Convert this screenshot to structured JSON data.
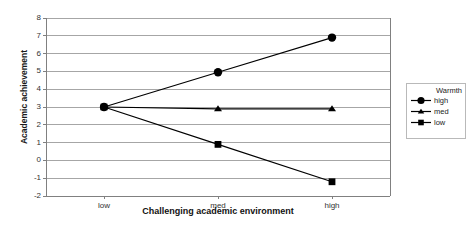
{
  "chart_data": {
    "type": "line",
    "title": "",
    "xlabel": "Challenging academic environment",
    "ylabel": "Academic achievement",
    "categories": [
      "low",
      "med",
      "high"
    ],
    "ylim": [
      -2,
      8
    ],
    "ytick_step": 1,
    "yticks": [
      "8",
      "7",
      "6",
      "5",
      "4",
      "3",
      "2",
      "1",
      "0",
      "-1",
      "-2"
    ],
    "grid": "horizontal",
    "legend_position": "right",
    "legend_title": "Warmth",
    "series": [
      {
        "name": "high",
        "marker": "circle",
        "values": [
          3,
          4.95,
          6.9
        ]
      },
      {
        "name": "med",
        "marker": "triangle",
        "values": [
          3,
          2.9,
          2.9
        ]
      },
      {
        "name": "low",
        "marker": "square",
        "values": [
          3,
          0.9,
          -1.2
        ]
      }
    ],
    "colors": {
      "line": "#000000",
      "marker": "#000000",
      "grid": "#a6a6a6",
      "axis": "#808080",
      "background": "#ffffff",
      "legend_border": "#b9b9b9"
    }
  }
}
